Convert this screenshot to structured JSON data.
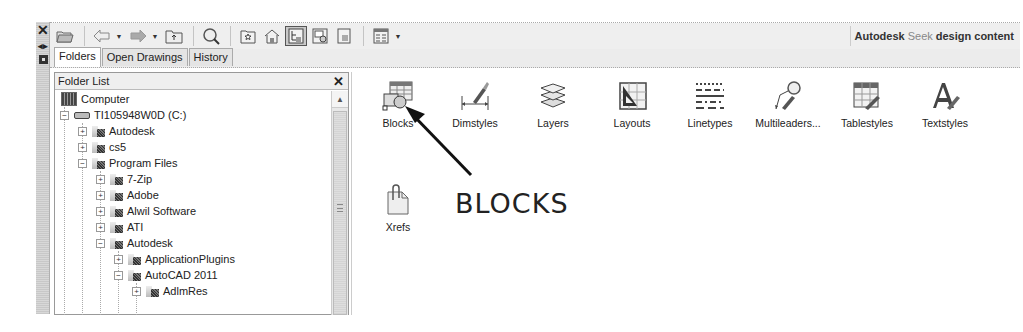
{
  "palette_strip": {
    "close_icon": "×",
    "autohide_icon": "auto-hide",
    "properties_icon": "properties"
  },
  "toolbar": {
    "buttons": [
      {
        "name": "load",
        "icon": "folder-open-icon"
      },
      {
        "name": "back",
        "icon": "back-arrow-icon"
      },
      {
        "name": "forward",
        "icon": "forward-arrow-icon"
      },
      {
        "name": "up",
        "icon": "up-folder-icon"
      },
      {
        "name": "search",
        "icon": "search-icon"
      },
      {
        "name": "favorites",
        "icon": "favorites-icon"
      },
      {
        "name": "home",
        "icon": "home-icon"
      },
      {
        "name": "tree-view-toggle",
        "icon": "tree-view-icon",
        "active": true
      },
      {
        "name": "preview",
        "icon": "preview-icon"
      },
      {
        "name": "description",
        "icon": "description-icon"
      },
      {
        "name": "views",
        "icon": "views-icon"
      }
    ],
    "seek": {
      "brand": "Autodesk",
      "seek_word": "Seek",
      "rest": "design content"
    }
  },
  "tabs": [
    {
      "label": "Folders",
      "active": true
    },
    {
      "label": "Open Drawings",
      "active": false
    },
    {
      "label": "History",
      "active": false
    }
  ],
  "folder_pane": {
    "title": "Folder List",
    "close": "×",
    "tree": [
      {
        "label": "Computer",
        "level": 0,
        "type": "computer",
        "expander": ""
      },
      {
        "label": "TI105948W0D (C:)",
        "level": 1,
        "type": "drive",
        "expander": "−"
      },
      {
        "label": "Autodesk",
        "level": 2,
        "type": "folder",
        "expander": "+"
      },
      {
        "label": "cs5",
        "level": 2,
        "type": "folder",
        "expander": "+"
      },
      {
        "label": "Program Files",
        "level": 2,
        "type": "folder",
        "expander": "−"
      },
      {
        "label": "7-Zip",
        "level": 3,
        "type": "folder",
        "expander": "+"
      },
      {
        "label": "Adobe",
        "level": 3,
        "type": "folder",
        "expander": "+"
      },
      {
        "label": "Alwil Software",
        "level": 3,
        "type": "folder",
        "expander": "+"
      },
      {
        "label": "ATI",
        "level": 3,
        "type": "folder",
        "expander": "+"
      },
      {
        "label": "Autodesk",
        "level": 3,
        "type": "folder",
        "expander": "−"
      },
      {
        "label": "ApplicationPlugins",
        "level": 4,
        "type": "folder",
        "expander": "+"
      },
      {
        "label": "AutoCAD 2011",
        "level": 4,
        "type": "folder",
        "expander": "−"
      },
      {
        "label": "AdlmRes",
        "level": 5,
        "type": "folder",
        "expander": "+"
      }
    ]
  },
  "content": {
    "items": [
      {
        "label": "Blocks",
        "icon": "blocks-icon"
      },
      {
        "label": "Dimstyles",
        "icon": "dimstyles-icon"
      },
      {
        "label": "Layers",
        "icon": "layers-icon"
      },
      {
        "label": "Layouts",
        "icon": "layouts-icon"
      },
      {
        "label": "Linetypes",
        "icon": "linetypes-icon"
      },
      {
        "label": "Multileaders...",
        "icon": "multileaders-icon"
      },
      {
        "label": "Tablestyles",
        "icon": "tablestyles-icon"
      },
      {
        "label": "Textstyles",
        "icon": "textstyles-icon"
      },
      {
        "label": "Xrefs",
        "icon": "xrefs-icon"
      }
    ]
  },
  "annotation": {
    "text": "BLOCKS",
    "points_to": "Blocks"
  }
}
